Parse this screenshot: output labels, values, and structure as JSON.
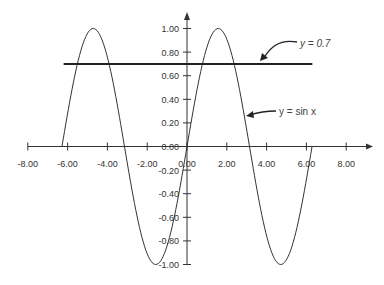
{
  "chart_data": {
    "type": "line",
    "title": "",
    "xlabel": "",
    "ylabel": "",
    "xlim": [
      -8,
      8
    ],
    "ylim": [
      -1,
      1
    ],
    "grid": false,
    "x_ticks": [
      -8,
      -6,
      -4,
      -2,
      0,
      2,
      4,
      6,
      8
    ],
    "x_tick_labels": [
      "-8.00",
      "-6.00",
      "-4.00",
      "-2.00",
      "0.00",
      "2.00",
      "4.00",
      "6.00",
      "8.00"
    ],
    "y_ticks": [
      1.0,
      0.8,
      0.6,
      0.4,
      0.2,
      0.0,
      -0.2,
      -0.4,
      -0.6,
      -0.8,
      -1.0
    ],
    "y_tick_labels": [
      "1.00",
      "0.80",
      "0.60",
      "0.40",
      "0.20",
      "0.00",
      "-0.20",
      "-0.40",
      "-0.60",
      "-0.80",
      "-1.00"
    ],
    "series": [
      {
        "name": "y = sin x",
        "function": "sin",
        "x_range": [
          -6.28,
          6.28
        ],
        "x": [
          -6.28,
          -5.5,
          -4.71,
          -3.93,
          -3.14,
          -2.36,
          -1.57,
          -0.79,
          0,
          0.79,
          1.57,
          2.36,
          3.14,
          3.93,
          4.71,
          5.5,
          6.28
        ],
        "values": [
          0,
          0.71,
          1,
          0.71,
          0,
          -0.71,
          -1,
          -0.71,
          0,
          0.71,
          1,
          0.71,
          0,
          -0.71,
          -1,
          -0.71,
          0
        ],
        "color": "#333333"
      },
      {
        "name": "y = 0.7",
        "x": [
          -6.2,
          6.3
        ],
        "values": [
          0.7,
          0.7
        ],
        "color": "#222222"
      }
    ],
    "annotations": [
      {
        "text": "y = 0.7",
        "arrow_to": [
          4.0,
          0.7
        ]
      },
      {
        "text": "y = sin x",
        "arrow_to": [
          3.0,
          0.14
        ]
      }
    ],
    "legend": "none"
  }
}
